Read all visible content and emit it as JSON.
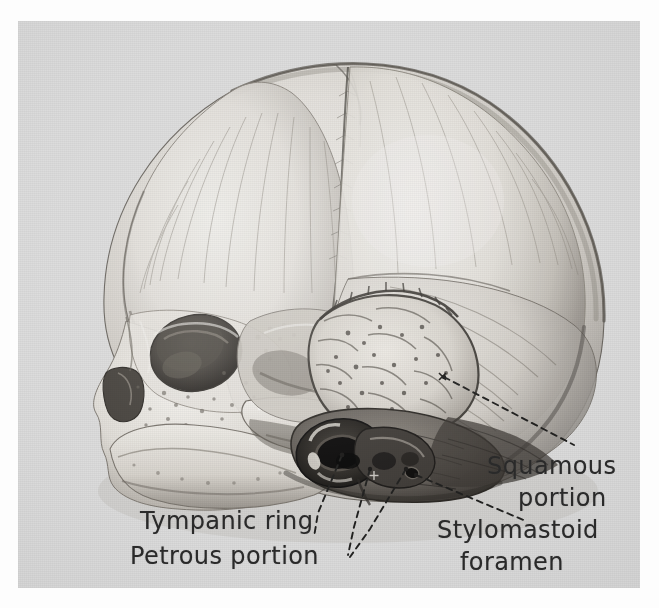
{
  "figure": {
    "kind": "anatomical-illustration",
    "medium": "halftone photographic plate scan",
    "plate_background_color": "#dcdcdc",
    "page_background_color": "#fdfdfd",
    "ink_color": "#2a2a2a"
  },
  "labels": [
    {
      "id": "tympanic-ring",
      "text": "Tympanic ring",
      "leader": "dashed",
      "side": "left"
    },
    {
      "id": "petrous-portion",
      "text": "Petrous portion",
      "leader": "dashed",
      "side": "left"
    },
    {
      "id": "squamous-portion",
      "line1": "Squamous",
      "line2": "portion",
      "leader": "dashed",
      "side": "right"
    },
    {
      "id": "stylomastoid-foramen",
      "line1": "Stylomastoid",
      "line2": "foramen",
      "leader": "dashed",
      "side": "right"
    }
  ],
  "structures": [
    "frontal bone",
    "parietal bone",
    "occipital bone",
    "coronal suture",
    "sagittal suture",
    "lambdoid suture",
    "anterior fontanelle",
    "orbit",
    "nasal aperture",
    "maxilla",
    "mandible",
    "zygomatic arch",
    "squamous portion of temporal bone",
    "tympanic ring",
    "petrous portion of temporal bone",
    "stylomastoid foramen",
    "mastoid region"
  ]
}
